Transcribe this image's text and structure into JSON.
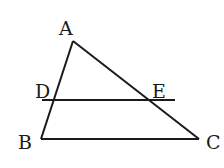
{
  "diagram": {
    "type": "triangle-with-parallel-line",
    "stroke_color": "#1a1a1a",
    "background": "#ffffff",
    "points": {
      "A": {
        "label": "A",
        "x": 73,
        "y": 41
      },
      "B": {
        "label": "B",
        "x": 41,
        "y": 139
      },
      "C": {
        "label": "C",
        "x": 199,
        "y": 139
      },
      "D": {
        "label": "D",
        "x": 54,
        "y": 100
      },
      "E": {
        "label": "E",
        "x": 150,
        "y": 100
      }
    },
    "segments": [
      {
        "from": "A",
        "to": "B"
      },
      {
        "from": "A",
        "to": "C"
      },
      {
        "from": "B",
        "to": "C"
      }
    ],
    "line_DE": {
      "x1": 42,
      "y1": 100,
      "x2": 175,
      "y2": 100
    }
  }
}
